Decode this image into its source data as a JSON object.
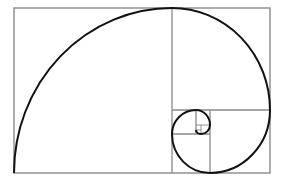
{
  "diagram": {
    "type": "golden-spiral",
    "colors": {
      "background": "#ffffff",
      "grid": "#8a8a8a",
      "spiral": "#111111"
    },
    "outer_rect": {
      "x": 14,
      "y": 8,
      "w": 256,
      "h": 165
    },
    "grid_lines": [
      {
        "x1": 172,
        "y1": 8,
        "x2": 172,
        "y2": 173
      },
      {
        "x1": 172,
        "y1": 110,
        "x2": 270,
        "y2": 110
      },
      {
        "x1": 210,
        "y1": 110,
        "x2": 210,
        "y2": 173
      },
      {
        "x1": 172,
        "y1": 134,
        "x2": 210,
        "y2": 134
      },
      {
        "x1": 196,
        "y1": 110,
        "x2": 196,
        "y2": 134
      },
      {
        "x1": 196,
        "y1": 125,
        "x2": 210,
        "y2": 125
      },
      {
        "x1": 201,
        "y1": 125,
        "x2": 201,
        "y2": 134
      },
      {
        "x1": 196,
        "y1": 130,
        "x2": 201,
        "y2": 130
      }
    ],
    "spiral_path": "M14,173 A158,165 0 0 1 172,8 A98,102 0 0 1 270,110 A60,63 0 0 1 210,173 A38,39 0 0 1 172,134 A24,24 0 0 1 196,110 A14,15 0 0 1 210,125 A9,9 0 0 1 201,134 A5,4 0 0 1 196,130"
  }
}
